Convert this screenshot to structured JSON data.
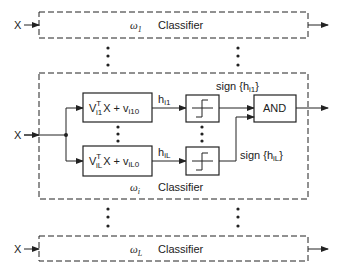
{
  "diagram": {
    "input_label": "X",
    "top_classifier": {
      "omega": "ω",
      "subscript": "1",
      "label": "Classifier"
    },
    "middle_classifier": {
      "omega": "ω",
      "subscript": "i",
      "label": "Classifier",
      "upper_linear": {
        "V": "V",
        "sup": "T",
        "sub": "i1",
        "mid": "X + v",
        "tail_sub": "i10"
      },
      "lower_linear": {
        "V": "V",
        "sup": "T",
        "sub": "iL",
        "mid": "X + v",
        "tail_sub": "iL0"
      },
      "upper_h": {
        "h": "h",
        "sub": "i1"
      },
      "lower_h": {
        "h": "h",
        "sub": "iL"
      },
      "upper_sign": {
        "prefix": "sign",
        "h": "h",
        "sub": "i1"
      },
      "lower_sign": {
        "prefix": "sign",
        "h": "h",
        "sub": "iL"
      },
      "and_label": "AND"
    },
    "bottom_classifier": {
      "omega": "ω",
      "subscript": "L",
      "label": "Classifier"
    },
    "ellipsis": "⋮"
  }
}
